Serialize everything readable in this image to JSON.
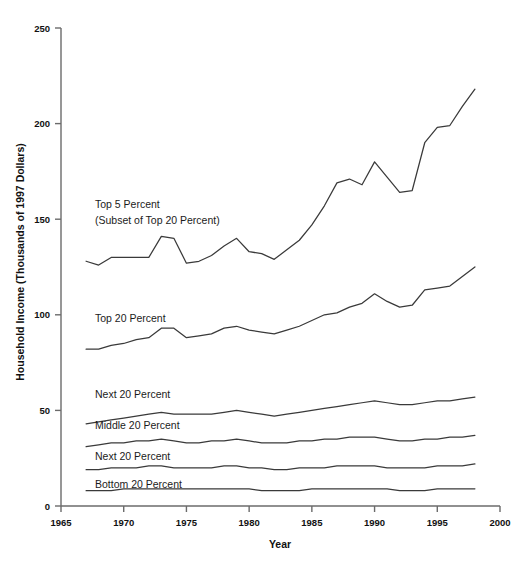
{
  "chart_data": {
    "type": "line",
    "title": "",
    "xlabel": "Year",
    "ylabel": "Household Income (Thousands of 1997 Dollars)",
    "xlim": [
      1965,
      2000
    ],
    "ylim": [
      0,
      250
    ],
    "xticks": [
      1965,
      1970,
      1975,
      1980,
      1985,
      1990,
      1995,
      2000
    ],
    "yticks": [
      0,
      50,
      100,
      150,
      200,
      250
    ],
    "grid": false,
    "legend_position": "inline-labels",
    "x": [
      1967,
      1968,
      1969,
      1970,
      1971,
      1972,
      1973,
      1974,
      1975,
      1976,
      1977,
      1978,
      1979,
      1980,
      1981,
      1982,
      1983,
      1984,
      1985,
      1986,
      1987,
      1988,
      1989,
      1990,
      1991,
      1992,
      1993,
      1994,
      1995,
      1996,
      1997,
      1998
    ],
    "series": [
      {
        "name": "Top 5 Percent",
        "label": "Top 5 Percent",
        "sublabel": "(Subset of Top 20 Percent)",
        "values": [
          128,
          126,
          130,
          130,
          130,
          130,
          141,
          140,
          127,
          128,
          131,
          136,
          140,
          133,
          132,
          129,
          134,
          139,
          147,
          157,
          169,
          171,
          168,
          180,
          172,
          164,
          165,
          190,
          198,
          199,
          209,
          218
        ]
      },
      {
        "name": "Top 20 Percent",
        "label": "Top 20 Percent",
        "values": [
          82,
          82,
          84,
          85,
          87,
          88,
          93,
          93,
          88,
          89,
          90,
          93,
          94,
          92,
          91,
          90,
          92,
          94,
          97,
          100,
          101,
          104,
          106,
          111,
          107,
          104,
          105,
          113,
          114,
          115,
          120,
          125
        ]
      },
      {
        "name": "Next 20 Percent",
        "label": "Next 20 Percent",
        "values": [
          43,
          44,
          45,
          46,
          47,
          48,
          49,
          48,
          48,
          48,
          48,
          49,
          50,
          49,
          48,
          47,
          48,
          49,
          50,
          51,
          52,
          53,
          54,
          55,
          54,
          53,
          53,
          54,
          55,
          55,
          56,
          57
        ]
      },
      {
        "name": "Middle 20 Percent",
        "label": "Middle 20 Percent",
        "values": [
          31,
          32,
          33,
          33,
          34,
          34,
          35,
          34,
          33,
          33,
          34,
          34,
          35,
          34,
          33,
          33,
          33,
          34,
          34,
          35,
          35,
          36,
          36,
          36,
          35,
          34,
          34,
          35,
          35,
          36,
          36,
          37
        ]
      },
      {
        "name": "Next 20 Percent (second quintile)",
        "label": "Next 20 Percent",
        "values": [
          19,
          19,
          20,
          20,
          20,
          21,
          21,
          20,
          20,
          20,
          20,
          21,
          21,
          20,
          20,
          19,
          19,
          20,
          20,
          20,
          21,
          21,
          21,
          21,
          20,
          20,
          20,
          20,
          21,
          21,
          21,
          22
        ]
      },
      {
        "name": "Bottom 20 Percent",
        "label": "Bottom 20 Percent",
        "values": [
          8,
          8,
          8,
          9,
          9,
          9,
          9,
          9,
          9,
          9,
          9,
          9,
          9,
          9,
          8,
          8,
          8,
          8,
          9,
          9,
          9,
          9,
          9,
          9,
          9,
          8,
          8,
          8,
          9,
          9,
          9,
          9
        ]
      }
    ],
    "labels_inline": [
      {
        "name": "top5",
        "text": "Top 5 Percent",
        "x": 95,
        "y": 208
      },
      {
        "name": "top5-sub",
        "text": "(Subset of Top 20 Percent)",
        "x": 95,
        "y": 224
      },
      {
        "name": "top20",
        "text": "Top 20 Percent",
        "x": 95,
        "y": 322
      },
      {
        "name": "next20-upper",
        "text": "Next 20 Percent",
        "x": 95,
        "y": 398
      },
      {
        "name": "middle20",
        "text": "Middle 20 Percent",
        "x": 95,
        "y": 429
      },
      {
        "name": "next20-lower",
        "text": "Next 20 Percent",
        "x": 95,
        "y": 460
      },
      {
        "name": "bottom20",
        "text": "Bottom 20 Percent",
        "x": 95,
        "y": 488
      }
    ],
    "colors": {
      "line": "#3a3a3a",
      "axis": "#6b6b6b",
      "text": "#111111",
      "background": "#ffffff"
    }
  },
  "axis": {
    "y_tick_labels": [
      "250",
      "200",
      "150",
      "100",
      "50",
      "0"
    ],
    "x_tick_labels": [
      "1965",
      "1970",
      "1975",
      "1980",
      "1985",
      "1990",
      "1995",
      "2000"
    ],
    "x_title": "Year",
    "y_title": "Household Income (Thousands of 1997 Dollars)"
  }
}
